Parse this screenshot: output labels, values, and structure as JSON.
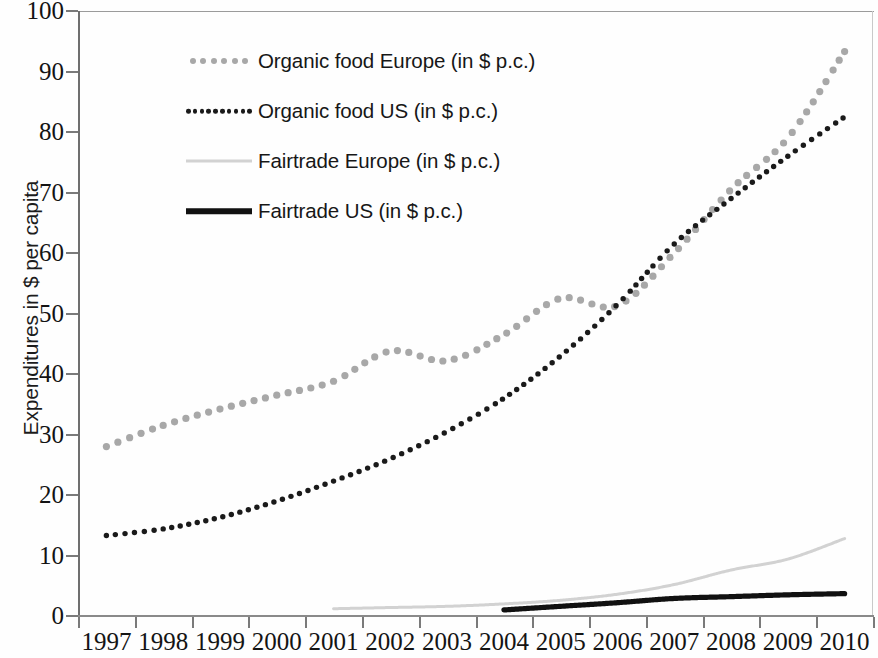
{
  "chart_data": {
    "type": "line",
    "title": "",
    "xlabel": "",
    "ylabel": "Expenditures in $ per capita",
    "categories": [
      "1997",
      "1998",
      "1999",
      "2000",
      "2001",
      "2002",
      "2003",
      "2004",
      "2005",
      "2006",
      "2007",
      "2008",
      "2009",
      "2010"
    ],
    "ylim": [
      0,
      100
    ],
    "y_ticks": [
      "100",
      "90",
      "80",
      "70",
      "60",
      "50",
      "40",
      "30",
      "20",
      "10",
      "0"
    ],
    "grid": false,
    "legend_position": "upper-left-inside",
    "series": [
      {
        "name": "Organic food Europe (in $ p.c.)",
        "color": "#a8a8a8",
        "style": "dotted",
        "values": [
          28.0,
          31.5,
          34.2,
          36.5,
          38.8,
          43.8,
          42.2,
          46.5,
          52.5,
          51.3,
          60.0,
          70.5,
          79.0,
          93.3
        ]
      },
      {
        "name": "Organic food US (in $ p.c.)",
        "color": "#1a1a1a",
        "style": "dotted",
        "values": [
          13.3,
          14.4,
          16.3,
          19.0,
          22.3,
          26.0,
          30.5,
          36.0,
          43.0,
          51.5,
          61.5,
          69.0,
          76.0,
          82.5
        ]
      },
      {
        "name": "Fairtrade Europe (in $ p.c.)",
        "color": "#d2d2d2",
        "style": "solid-thin",
        "values": [
          null,
          null,
          null,
          null,
          1.2,
          1.4,
          1.6,
          2.0,
          2.6,
          3.6,
          5.2,
          7.6,
          9.4,
          12.8
        ]
      },
      {
        "name": "Fairtrade US (in $ p.c.)",
        "color": "#111111",
        "style": "solid-thick",
        "values": [
          null,
          null,
          null,
          null,
          null,
          null,
          null,
          1.0,
          1.6,
          2.2,
          2.9,
          3.2,
          3.5,
          3.7
        ]
      }
    ]
  },
  "axis": {
    "y_title": "Expenditures in $ per capita"
  },
  "legend": {
    "items": [
      {
        "label": "Organic food Europe (in $ p.c.)",
        "marker": "dotted-gray-large"
      },
      {
        "label": "Organic food US (in $ p.c.)",
        "marker": "dotted-black-small"
      },
      {
        "label": "Fairtrade Europe (in $ p.c.)",
        "marker": "solid-lightgray-thin"
      },
      {
        "label": "Fairtrade US (in $ p.c.)",
        "marker": "solid-black-thick"
      }
    ]
  }
}
